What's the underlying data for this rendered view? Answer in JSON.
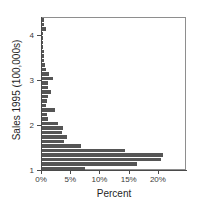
{
  "chart_data": {
    "type": "bar",
    "orientation": "horizontal",
    "title": "",
    "xlabel": "Percent",
    "ylabel": "Sales 1995 (100,000s)",
    "xlim": [
      0,
      24.8
    ],
    "ylim": [
      1.0,
      4.4
    ],
    "grid": false,
    "legend": null,
    "bar_color": "#555555",
    "frame_color": "#8e8e8e",
    "xticks": [
      0,
      5,
      10,
      15,
      20
    ],
    "xtick_labels": [
      "0%",
      "5%",
      "10%",
      "15%",
      "20%"
    ],
    "yticks": [
      1,
      2,
      3,
      4
    ],
    "ytick_labels": [
      "1",
      "2",
      "3",
      "4"
    ],
    "bin_width": 0.1,
    "categories": [
      1.05,
      1.15,
      1.25,
      1.35,
      1.45,
      1.55,
      1.65,
      1.75,
      1.85,
      1.95,
      2.05,
      2.15,
      2.25,
      2.35,
      2.45,
      2.55,
      2.65,
      2.75,
      2.85,
      2.95,
      3.05,
      3.15,
      3.25,
      3.35,
      3.45,
      3.55,
      3.65,
      3.75,
      3.85,
      3.95,
      4.05,
      4.15,
      4.25,
      4.35
    ],
    "values": [
      7.3,
      16.3,
      20.3,
      20.7,
      14.2,
      6.7,
      3.8,
      4.3,
      3.5,
      3.6,
      2.8,
      1.0,
      0.9,
      2.2,
      0.7,
      0.8,
      1.1,
      1.5,
      1.0,
      1.1,
      1.9,
      1.2,
      0.7,
      0.5,
      0.4,
      0.4,
      0.3,
      0.2,
      0.2,
      0.2,
      0.2,
      0.6,
      0.4,
      0.3
    ]
  }
}
